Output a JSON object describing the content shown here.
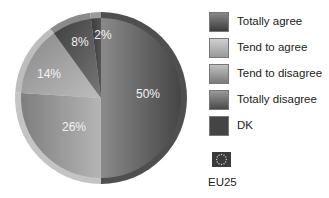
{
  "chart_data": {
    "type": "pie",
    "title": "",
    "categories": [
      "Totally agree",
      "Tend to agree",
      "Tend to disagree",
      "Totally disagree",
      "DK"
    ],
    "values": [
      50,
      26,
      14,
      8,
      2
    ],
    "labels": [
      "50%",
      "26%",
      "14%",
      "8%",
      "2%"
    ],
    "colors": [
      "#5e5e5e",
      "#9c9c9c",
      "#ababab",
      "#6a6a6a",
      "#4a4a4a"
    ],
    "start_angle_deg": 0,
    "direction": "clockwise",
    "legend_position": "right",
    "region": "EU25"
  },
  "legend": {
    "items": [
      {
        "label": "Totally agree",
        "color": "#5e5e5e"
      },
      {
        "label": "Tend to agree",
        "color": "#b0b0b0"
      },
      {
        "label": "Tend to disagree",
        "color": "#9a9a9a"
      },
      {
        "label": "Totally disagree",
        "color": "#6a6a6a"
      },
      {
        "label": "DK",
        "color": "#4a4a4a"
      }
    ],
    "flag_label": "EU25",
    "flag_icon": "eu-flag-icon"
  }
}
